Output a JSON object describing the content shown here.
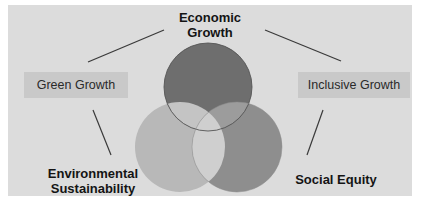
{
  "diagram": {
    "title": "",
    "nodes": {
      "economic_growth": {
        "label_line1": "Economic",
        "label_line2": "Growth",
        "color": "#6e6e6e"
      },
      "environmental_sustainability": {
        "label_line1": "Environmental",
        "label_line2": "Sustainability",
        "color": "#b8b8b8"
      },
      "social_equity": {
        "label": "Social Equity",
        "color": "#8e8e8e"
      }
    },
    "intersections": {
      "green_growth": {
        "label": "Green Growth",
        "between": [
          "Economic Growth",
          "Environmental Sustainability"
        ]
      },
      "inclusive_growth": {
        "label": "Inclusive Growth",
        "between": [
          "Economic Growth",
          "Social Equity"
        ]
      }
    },
    "colors": {
      "background": "#dcdcdc",
      "box": "#c9c9c9",
      "line": "#3a3a3a",
      "text": "#141414"
    }
  }
}
